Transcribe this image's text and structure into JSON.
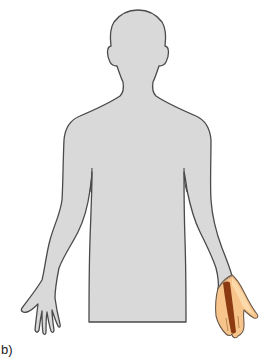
{
  "figure": {
    "panel_label": "b)",
    "highlighted_region": "right hand (ulnar/palmar side)"
  },
  "colors": {
    "body_fill": "#d9d9d9",
    "body_outline": "#4a4a4a",
    "highlight_fill": "#f7c58c",
    "highlight_light": "#fbd9a9",
    "highlight_stripe": "#8b3a12",
    "background": "#ffffff"
  }
}
